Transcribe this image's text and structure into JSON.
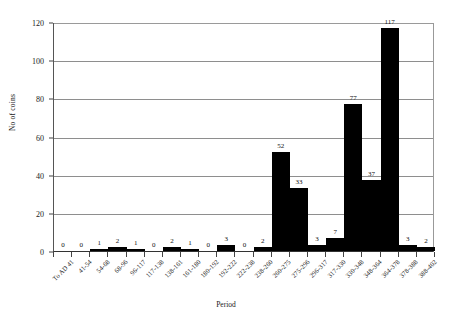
{
  "chart_data": {
    "type": "bar",
    "title": "",
    "xlabel": "Period",
    "ylabel": "No of coins",
    "ylim": [
      0,
      120
    ],
    "yticks": [
      0,
      20,
      40,
      60,
      80,
      100,
      120
    ],
    "grid": true,
    "legend": "none",
    "bar_color": "#000000",
    "categories": [
      "To AD 41",
      "41-54",
      "54-68",
      "68-96",
      "96-117",
      "117-138",
      "138-161",
      "161-180",
      "180-192",
      "192-222",
      "222-238",
      "238-260",
      "260-275",
      "275-296",
      "296-317",
      "317-330",
      "330-348",
      "348-364",
      "364-378",
      "378-388",
      "388-402"
    ],
    "values": [
      0,
      0,
      1,
      2,
      1,
      0,
      2,
      1,
      0,
      3,
      0,
      2,
      52,
      33,
      3,
      7,
      77,
      37,
      117,
      3,
      2
    ],
    "value_labels": [
      "0",
      "0",
      "1",
      "2",
      "1",
      "0",
      "2",
      "1",
      "0",
      "3",
      "0",
      "2",
      "52",
      "33",
      "3",
      "7",
      "77",
      "37",
      "117",
      "3",
      "2"
    ]
  }
}
